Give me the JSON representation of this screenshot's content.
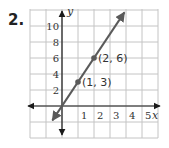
{
  "problem": {
    "number": "2."
  },
  "chart_data": {
    "type": "line",
    "title": "",
    "xlabel": "x",
    "ylabel": "y",
    "xlim": [
      -2,
      6
    ],
    "ylim": [
      -4,
      12
    ],
    "grid": true,
    "x_ticks": [
      1,
      2,
      3,
      4,
      5
    ],
    "y_ticks": [
      2,
      4,
      6,
      8,
      10
    ],
    "series": [
      {
        "name": "y = 3x",
        "slope": 3,
        "intercept": 0,
        "x": [
          -0.6,
          0,
          1,
          2,
          3.9
        ],
        "y": [
          -1.8,
          0,
          3,
          6,
          11.7
        ],
        "color": "#5a5a5a"
      }
    ],
    "points": [
      {
        "x": 1,
        "y": 3,
        "label": "(1, 3)"
      },
      {
        "x": 2,
        "y": 6,
        "label": "(2, 6)"
      }
    ]
  },
  "colors": {
    "grid": "#c4c4c4",
    "axis": "#1a1a1a",
    "line": "#5a5a5a"
  }
}
